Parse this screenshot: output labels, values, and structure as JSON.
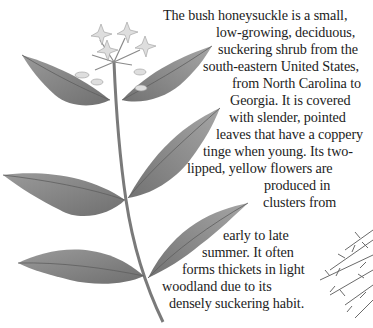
{
  "page": {
    "background": "#ffffff",
    "text_color": "#1c1c1c"
  },
  "illustrations": [
    {
      "name": "bush-honeysuckle-branch",
      "description": "Botanical drawing of a bush honeysuckle stem with paired pointed serrated leaves and a cluster of pale flowers at top"
    },
    {
      "name": "shrub-foliage",
      "description": "Partial drawing of dense feathery shrub foliage at bottom right edge"
    }
  ],
  "body_text": {
    "lines": [
      "The bush honeysuckle is a small,",
      "low-growing, deciduous,",
      "suckering shrub from the",
      "south-eastern United States,",
      "from North Carolina to",
      "Georgia. It is covered",
      "with slender, pointed",
      "leaves that have a coppery",
      "tinge when young. Its two-",
      "lipped, yellow flowers are",
      "produced in",
      "clusters from",
      "early to late",
      "summer. It often",
      "forms thickets in light",
      "woodland due to its",
      "densely suckering habit."
    ]
  }
}
